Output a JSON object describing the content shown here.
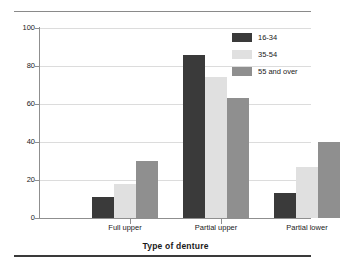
{
  "chart_data": {
    "type": "bar",
    "title": "",
    "xlabel": "Type of denture",
    "ylabel": "Percentage",
    "ylim": [
      0,
      100
    ],
    "yticks": [
      0,
      20,
      40,
      60,
      80,
      100
    ],
    "grid": true,
    "legend_position": "top-right",
    "categories": [
      "Full upper",
      "Partial upper",
      "Partial lower"
    ],
    "series": [
      {
        "name": "16-34",
        "color": "#3a3a3a",
        "values": [
          11,
          86,
          13
        ]
      },
      {
        "name": "35-54",
        "color": "#e0e0e0",
        "values": [
          18,
          74,
          27
        ]
      },
      {
        "name": "55 and over",
        "color": "#8f8f8f",
        "values": [
          30,
          63,
          40
        ]
      }
    ]
  },
  "axes": {
    "y_title": "Percentage",
    "x_title": "Type of denture",
    "y_tick_labels": [
      "0",
      "20",
      "40",
      "60",
      "80",
      "100"
    ],
    "x_tick_labels": [
      "Full upper",
      "Partial upper",
      "Partial lower"
    ]
  },
  "legend": {
    "items": [
      {
        "label": "16-34"
      },
      {
        "label": "35-54"
      },
      {
        "label": "55 and over"
      }
    ]
  }
}
